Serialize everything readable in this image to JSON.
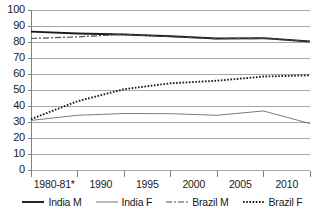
{
  "chart_data": {
    "type": "line",
    "title": "",
    "subtitle": "",
    "xlabel": "",
    "ylabel": "",
    "ylim": [
      0,
      100
    ],
    "ytick_labels": [
      "100",
      "90",
      "80",
      "70",
      "60",
      "50",
      "40",
      "30",
      "20",
      "10",
      "0"
    ],
    "ytick_values": [
      100,
      90,
      80,
      70,
      60,
      50,
      40,
      30,
      20,
      10,
      0
    ],
    "grid": true,
    "legend_position": "bottom",
    "categories": [
      "1980-81*",
      "1985",
      "1990",
      "1995",
      "2000",
      "2005",
      "2010"
    ],
    "xtick_labels": [
      "1980-81*",
      "1990",
      "1995",
      "2000",
      "2005",
      "2010"
    ],
    "x": [
      0,
      1,
      2,
      3,
      4,
      5,
      6
    ],
    "series": [
      {
        "name": "India M",
        "style": "solid-thick",
        "color": "#1a1a1a",
        "x": [
          0,
          1,
          2,
          3,
          4,
          5,
          6
        ],
        "categories": [
          "1980-81*",
          "1985",
          "1990",
          "1995",
          "2000",
          "2005",
          "2010"
        ],
        "values": [
          86.5,
          85.3,
          84.7,
          83.6,
          82.2,
          82.4,
          80.3
        ]
      },
      {
        "name": "India F",
        "style": "solid-thin",
        "color": "#6b6b6b",
        "x": [
          0,
          1,
          2,
          3,
          4,
          5,
          6
        ],
        "categories": [
          "1980-81*",
          "1985",
          "1990",
          "1995",
          "2000",
          "2005",
          "2010"
        ],
        "values": [
          31.0,
          34.2,
          35.3,
          35.2,
          34.2,
          36.9,
          29.0
        ]
      },
      {
        "name": "Brazil M",
        "style": "dash-dot",
        "color": "#4d4d4d",
        "x": [
          0,
          1,
          2,
          3,
          4,
          5,
          6
        ],
        "categories": [
          "1980-81*",
          "1985",
          "1990",
          "1995",
          "2000",
          "2005",
          "2010"
        ],
        "values": [
          82.2,
          83.2,
          84.8,
          83.4,
          82.0,
          82.2,
          80.3
        ]
      },
      {
        "name": "Brazil F",
        "style": "dotted",
        "color": "#1a1a1a",
        "x": [
          0,
          1,
          2,
          3,
          4,
          5,
          6
        ],
        "categories": [
          "1980-81*",
          "1985",
          "1990",
          "1995",
          "2000",
          "2005",
          "2010"
        ],
        "values": [
          31.8,
          43.0,
          50.5,
          54.2,
          55.8,
          58.4,
          59.2
        ]
      }
    ],
    "annotations": []
  },
  "axes": {
    "plot_left": 31,
    "plot_right": 310,
    "plot_top": 10,
    "plot_bottom": 170,
    "grid_color": "#a6a6a6",
    "axis_color": "#7f7f7f"
  },
  "legend": {
    "items": [
      {
        "label": "India M",
        "style": "solid-thick",
        "color": "#1a1a1a"
      },
      {
        "label": "India F",
        "style": "solid-thin",
        "color": "#6b6b6b"
      },
      {
        "label": "Brazil M",
        "style": "dash-dot",
        "color": "#4d4d4d"
      },
      {
        "label": "Brazil F",
        "style": "dotted",
        "color": "#1a1a1a"
      }
    ]
  }
}
